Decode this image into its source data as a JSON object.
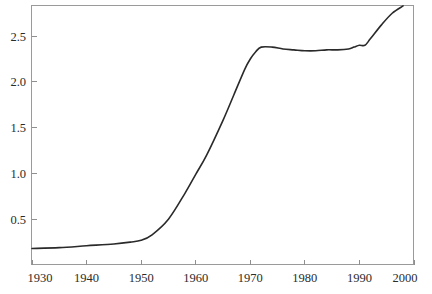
{
  "chart_data": {
    "type": "line",
    "title": "",
    "subtitle": "",
    "xlabel": "",
    "ylabel": "",
    "xlim": [
      1930,
      2000
    ],
    "ylim": [
      0.0,
      2.84
    ],
    "grid": false,
    "legend": null,
    "legend_position": "none",
    "annotations": [],
    "x_ticks": [
      1930,
      1940,
      1950,
      1960,
      1970,
      1980,
      1990,
      2000
    ],
    "x_tick_labels": [
      "1930",
      "1940",
      "1950",
      "1960",
      "1970",
      "1980",
      "1990",
      "2000"
    ],
    "y_ticks": [
      0.5,
      1.0,
      1.5,
      2.0,
      2.5
    ],
    "y_tick_labels": [
      "0.5",
      "1.0",
      "1.5",
      "2.0",
      "2.5"
    ],
    "series": [
      {
        "name": "series-1",
        "color": "#2a2a2a",
        "x": [
          1930,
          1935,
          1940,
          1945,
          1948,
          1950,
          1952,
          1955,
          1958,
          1960,
          1962,
          1965,
          1967,
          1969,
          1970,
          1971,
          1972,
          1974,
          1976,
          1978,
          1980,
          1982,
          1984,
          1986,
          1988,
          1989,
          1990,
          1991,
          1992,
          1994,
          1996,
          1998
        ],
        "values": [
          0.18,
          0.19,
          0.21,
          0.23,
          0.25,
          0.27,
          0.33,
          0.5,
          0.78,
          0.99,
          1.2,
          1.58,
          1.86,
          2.14,
          2.25,
          2.33,
          2.38,
          2.38,
          2.36,
          2.35,
          2.34,
          2.34,
          2.35,
          2.35,
          2.36,
          2.38,
          2.4,
          2.4,
          2.47,
          2.62,
          2.75,
          2.83
        ]
      }
    ]
  },
  "axes": {
    "frame_color": "#9a9a9a",
    "tick_color": "#8f8f8f",
    "label_color": "#2b2b2b"
  }
}
